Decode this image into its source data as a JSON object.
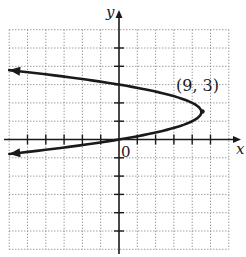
{
  "chart_data": {
    "type": "line",
    "title": "",
    "xlabel": "x",
    "ylabel": "y",
    "origin_label": "0",
    "equation": "x = -(y - 3)^2 + 9",
    "xlim": [
      -12,
      12
    ],
    "ylim": [
      -12,
      12
    ],
    "tick_step": 2,
    "grid": true,
    "grid_style": "dotted",
    "series": [
      {
        "name": "parabola",
        "orientation": "opens-left",
        "vertex": [
          9,
          3
        ],
        "points": [
          {
            "x": -12,
            "y": 7.58
          },
          {
            "x": 0,
            "y": 6
          },
          {
            "x": 5,
            "y": 5
          },
          {
            "x": 8,
            "y": 4
          },
          {
            "x": 9,
            "y": 3
          },
          {
            "x": 8,
            "y": 2
          },
          {
            "x": 5,
            "y": 1
          },
          {
            "x": 0,
            "y": 0
          },
          {
            "x": -12,
            "y": -1.58
          }
        ],
        "arrows": [
          "upper-left",
          "lower-left"
        ]
      }
    ],
    "annotations": [
      {
        "text": "(9, 3)",
        "x": 9,
        "y": 3,
        "position": "above-left"
      }
    ]
  },
  "labels": {
    "x_axis": "x",
    "y_axis": "y",
    "origin": "0",
    "vertex": "(9, 3)"
  }
}
